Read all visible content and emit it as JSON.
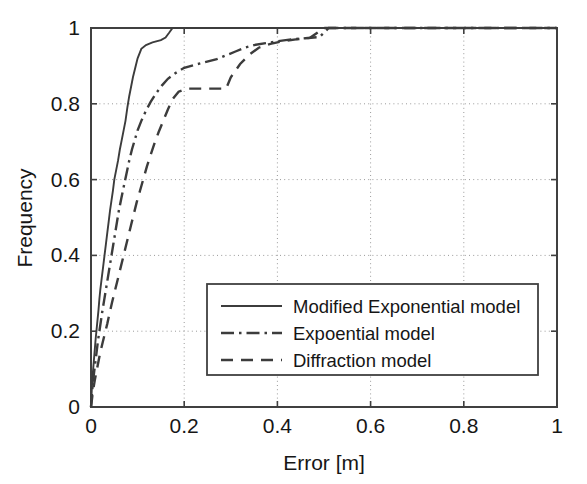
{
  "chart_data": {
    "type": "line",
    "title": "",
    "subtitle": "",
    "xlabel": "Error [m]",
    "ylabel": "Frequency",
    "xlim": [
      0,
      1
    ],
    "ylim": [
      0,
      1
    ],
    "xticks": [
      "0",
      "0.2",
      "0.4",
      "0.6",
      "0.8",
      "1"
    ],
    "xtick_values": [
      0,
      0.2,
      0.4,
      0.6,
      0.8,
      1
    ],
    "yticks": [
      "0",
      "0.2",
      "0.4",
      "0.6",
      "0.8",
      "1"
    ],
    "ytick_values": [
      0,
      0.2,
      0.4,
      0.6,
      0.8,
      1
    ],
    "grid": true,
    "grid_style": "dotted",
    "legend_position": "lower right",
    "line_color": "#3c3c3c",
    "axis_color": "#404040",
    "background": "#ffffff",
    "series": [
      {
        "name": "Modified Exponential model",
        "dash": "solid",
        "points": [
          [
            0.0,
            0.0
          ],
          [
            0.002,
            0.055
          ],
          [
            0.004,
            0.09
          ],
          [
            0.006,
            0.12
          ],
          [
            0.008,
            0.15
          ],
          [
            0.01,
            0.18
          ],
          [
            0.012,
            0.205
          ],
          [
            0.014,
            0.23
          ],
          [
            0.016,
            0.255
          ],
          [
            0.018,
            0.285
          ],
          [
            0.02,
            0.31
          ],
          [
            0.023,
            0.34
          ],
          [
            0.026,
            0.37
          ],
          [
            0.029,
            0.4
          ],
          [
            0.032,
            0.43
          ],
          [
            0.035,
            0.46
          ],
          [
            0.038,
            0.49
          ],
          [
            0.041,
            0.52
          ],
          [
            0.044,
            0.545
          ],
          [
            0.047,
            0.57
          ],
          [
            0.05,
            0.6
          ],
          [
            0.054,
            0.625
          ],
          [
            0.058,
            0.65
          ],
          [
            0.062,
            0.68
          ],
          [
            0.066,
            0.705
          ],
          [
            0.07,
            0.73
          ],
          [
            0.074,
            0.755
          ],
          [
            0.078,
            0.79
          ],
          [
            0.082,
            0.82
          ],
          [
            0.086,
            0.845
          ],
          [
            0.09,
            0.87
          ],
          [
            0.095,
            0.895
          ],
          [
            0.1,
            0.92
          ],
          [
            0.108,
            0.945
          ],
          [
            0.118,
            0.955
          ],
          [
            0.132,
            0.962
          ],
          [
            0.15,
            0.968
          ],
          [
            0.16,
            0.975
          ],
          [
            0.168,
            0.988
          ],
          [
            0.175,
            1.0
          ],
          [
            1.0,
            1.0
          ]
        ]
      },
      {
        "name": "Expoential model",
        "dash": "dashdot",
        "points": [
          [
            0.0,
            0.0
          ],
          [
            0.003,
            0.05
          ],
          [
            0.006,
            0.085
          ],
          [
            0.009,
            0.115
          ],
          [
            0.012,
            0.145
          ],
          [
            0.015,
            0.175
          ],
          [
            0.018,
            0.2
          ],
          [
            0.021,
            0.225
          ],
          [
            0.024,
            0.25
          ],
          [
            0.028,
            0.28
          ],
          [
            0.032,
            0.31
          ],
          [
            0.036,
            0.34
          ],
          [
            0.04,
            0.37
          ],
          [
            0.044,
            0.4
          ],
          [
            0.048,
            0.43
          ],
          [
            0.052,
            0.46
          ],
          [
            0.056,
            0.49
          ],
          [
            0.06,
            0.52
          ],
          [
            0.065,
            0.55
          ],
          [
            0.07,
            0.58
          ],
          [
            0.076,
            0.615
          ],
          [
            0.082,
            0.65
          ],
          [
            0.088,
            0.68
          ],
          [
            0.094,
            0.705
          ],
          [
            0.1,
            0.73
          ],
          [
            0.108,
            0.755
          ],
          [
            0.118,
            0.782
          ],
          [
            0.128,
            0.805
          ],
          [
            0.14,
            0.828
          ],
          [
            0.152,
            0.848
          ],
          [
            0.165,
            0.866
          ],
          [
            0.18,
            0.88
          ],
          [
            0.2,
            0.895
          ],
          [
            0.22,
            0.902
          ],
          [
            0.245,
            0.91
          ],
          [
            0.27,
            0.918
          ],
          [
            0.29,
            0.928
          ],
          [
            0.31,
            0.938
          ],
          [
            0.33,
            0.948
          ],
          [
            0.35,
            0.955
          ],
          [
            0.375,
            0.96
          ],
          [
            0.4,
            0.965
          ],
          [
            0.43,
            0.97
          ],
          [
            0.46,
            0.973
          ],
          [
            0.49,
            0.976
          ],
          [
            0.51,
            1.0
          ],
          [
            1.0,
            1.0
          ]
        ]
      },
      {
        "name": "Diffraction model",
        "dash": "dashed",
        "points": [
          [
            0.0,
            0.0
          ],
          [
            0.004,
            0.04
          ],
          [
            0.008,
            0.07
          ],
          [
            0.012,
            0.095
          ],
          [
            0.016,
            0.12
          ],
          [
            0.02,
            0.145
          ],
          [
            0.025,
            0.17
          ],
          [
            0.03,
            0.195
          ],
          [
            0.035,
            0.22
          ],
          [
            0.04,
            0.248
          ],
          [
            0.045,
            0.275
          ],
          [
            0.05,
            0.3
          ],
          [
            0.056,
            0.33
          ],
          [
            0.062,
            0.36
          ],
          [
            0.068,
            0.39
          ],
          [
            0.074,
            0.42
          ],
          [
            0.08,
            0.45
          ],
          [
            0.086,
            0.48
          ],
          [
            0.092,
            0.51
          ],
          [
            0.098,
            0.54
          ],
          [
            0.105,
            0.57
          ],
          [
            0.112,
            0.6
          ],
          [
            0.12,
            0.635
          ],
          [
            0.128,
            0.665
          ],
          [
            0.136,
            0.695
          ],
          [
            0.145,
            0.725
          ],
          [
            0.155,
            0.755
          ],
          [
            0.165,
            0.785
          ],
          [
            0.175,
            0.812
          ],
          [
            0.188,
            0.832
          ],
          [
            0.205,
            0.84
          ],
          [
            0.29,
            0.84
          ],
          [
            0.3,
            0.87
          ],
          [
            0.32,
            0.905
          ],
          [
            0.34,
            0.93
          ],
          [
            0.36,
            0.948
          ],
          [
            0.385,
            0.958
          ],
          [
            0.41,
            0.965
          ],
          [
            0.44,
            0.97
          ],
          [
            0.47,
            0.974
          ],
          [
            0.5,
            1.0
          ],
          [
            1.0,
            1.0
          ]
        ]
      }
    ]
  },
  "legend": {
    "items": [
      {
        "label": "Modified Exponential model",
        "dash": "solid"
      },
      {
        "label": "Expoential model",
        "dash": "dashdot"
      },
      {
        "label": "Diffraction model",
        "dash": "dashed"
      }
    ]
  }
}
